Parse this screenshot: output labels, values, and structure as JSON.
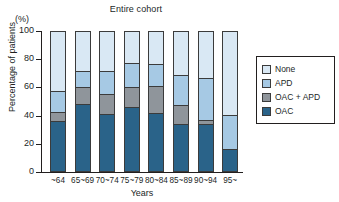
{
  "chart_data": {
    "type": "bar",
    "stacked": true,
    "title": "Entire cohort",
    "xlabel": "Years",
    "ylabel": "Percentage of patients",
    "unit_label": "(%)",
    "ylim": [
      0,
      100
    ],
    "yticks": [
      0,
      20,
      40,
      60,
      80,
      100
    ],
    "ytick_labels": [
      "0",
      "20",
      "40",
      "60",
      "80",
      "100"
    ],
    "grid": false,
    "legend_position": "right",
    "categories": [
      "~64",
      "65~69",
      "70~74",
      "75~79",
      "80~84",
      "85~89",
      "90~94",
      "95~"
    ],
    "series": [
      {
        "name": "OAC",
        "color": "#2a6389",
        "values": [
          35,
          47.5,
          40,
          45,
          41,
          33,
          33,
          15
        ]
      },
      {
        "name": "OAC + APD",
        "color": "#8f959b",
        "values": [
          7,
          12.5,
          15,
          15,
          19.5,
          14,
          3,
          0
        ]
      },
      {
        "name": "APD",
        "color": "#a6c9e4",
        "values": [
          15,
          11,
          16,
          17,
          15.5,
          21,
          30,
          24.5
        ]
      },
      {
        "name": "None",
        "color": "#d9e8f4",
        "values": [
          43,
          29,
          29,
          23,
          24,
          32,
          34,
          60.5
        ]
      }
    ],
    "cumulative_tops": {
      "OAC": [
        35,
        47.5,
        40,
        45,
        41,
        33,
        33,
        15
      ],
      "OAC + APD": [
        42,
        60,
        55,
        60,
        60.5,
        47,
        36,
        15
      ],
      "APD": [
        57,
        71,
        71,
        77,
        76,
        68,
        66,
        39.5
      ],
      "None": [
        100,
        100,
        100,
        100,
        100,
        100,
        100,
        100
      ]
    },
    "legend": [
      {
        "label": "None",
        "color": "#d9e8f4"
      },
      {
        "label": "APD",
        "color": "#a6c9e4"
      },
      {
        "label": "OAC + APD",
        "color": "#8f959b"
      },
      {
        "label": "OAC",
        "color": "#2a6389"
      }
    ]
  }
}
